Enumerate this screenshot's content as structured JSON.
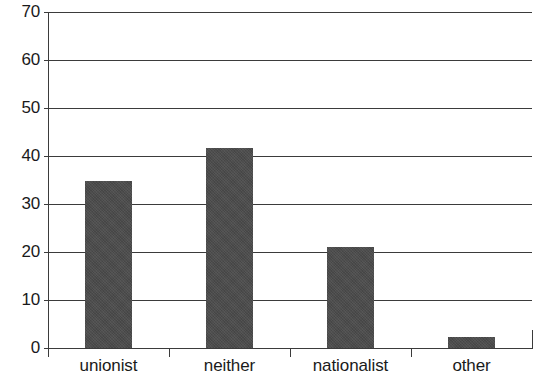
{
  "chart_data": {
    "type": "bar",
    "title": "",
    "subtitle": "",
    "xlabel": "",
    "ylabel": "",
    "categories": [
      "unionist",
      "neither",
      "nationalist",
      "other"
    ],
    "values": [
      34.8,
      41.7,
      21.0,
      2.3
    ],
    "ylim": [
      0,
      70
    ],
    "yticks": [
      0,
      10,
      20,
      30,
      40,
      50,
      60,
      70
    ],
    "ytick_labels": [
      "0",
      "10",
      "20",
      "30",
      "40",
      "50",
      "60",
      "70"
    ],
    "grid": true,
    "grid_axis": "y",
    "legend": false,
    "legend_position": "none",
    "bar_color": "#4c4c4c",
    "axis_color": "#3b3b3b",
    "background_color": "#ffffff"
  }
}
